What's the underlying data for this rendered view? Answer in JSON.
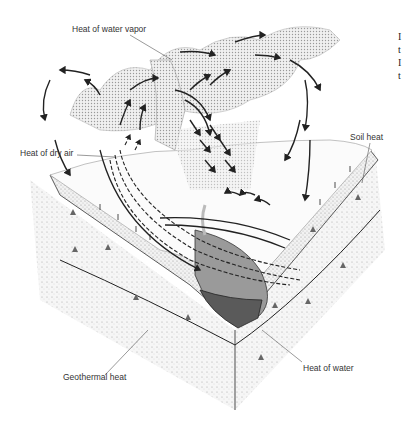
{
  "diagram": {
    "type": "illustration",
    "labels": {
      "water_vapor": "Heat of water vapor",
      "dry_air": "Heat of dry air",
      "soil": "Soil heat",
      "geothermal": "Geothermal heat",
      "water": "Heat of water"
    },
    "edge_text_fragments": [
      "I",
      "t",
      "I",
      "t"
    ],
    "colors": {
      "ink": "#222222",
      "soil_stipple": "#c8c8c8",
      "water_light": "#9a9a9a",
      "water_dark": "#5a5a5a",
      "cloud": "#b0b0b0"
    }
  }
}
